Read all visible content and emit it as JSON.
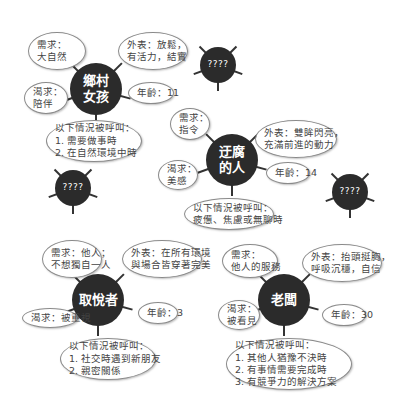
{
  "characters": [
    {
      "name_lines": [
        "鄉村",
        "女孩"
      ],
      "need": [
        "需求：",
        "大自然"
      ],
      "appearance": [
        "外表：放鬆，",
        "有活力，結實"
      ],
      "desire": [
        "渴求：",
        "陪伴"
      ],
      "age": "年齡：11",
      "called_when": [
        "以下情況被呼叫：",
        "1. 需要做事時",
        "2. 在自然環境中時"
      ]
    },
    {
      "name_lines": [
        "迂腐",
        "的人"
      ],
      "need": [
        "需求：",
        "指令"
      ],
      "appearance": [
        "外表：雙眸閃亮，",
        "充滿前進的動力"
      ],
      "desire": [
        "渴求：",
        "美感"
      ],
      "age": "年齡：14",
      "called_when": [
        "以下情況被呼叫：",
        "疲憊、焦慮或無聊時"
      ]
    },
    {
      "name_lines": [
        "取悅者"
      ],
      "need": [
        "需求：他人；",
        "不想獨自一人"
      ],
      "appearance": [
        "外表：在所有環境",
        "與場合皆穿著完美"
      ],
      "desire": [
        "渴求：被重視"
      ],
      "age": "年齡：3",
      "called_when": [
        "以下情況被呼叫：",
        "1. 社交時遇到新朋友",
        "2. 親密關係"
      ]
    },
    {
      "name_lines": [
        "老闆"
      ],
      "need": [
        "需求：",
        "他人的服務"
      ],
      "appearance": [
        "外表：抬頭挺胸，",
        "呼吸沉穩，自信"
      ],
      "desire": [
        "渴求：",
        "被看見"
      ],
      "age": "年齡：30",
      "called_when": [
        "以下情況被呼叫：",
        "1. 其他人猶豫不決時",
        "2. 有事情需要完成時",
        "3. 有競爭力的解決方案"
      ]
    }
  ],
  "unknown_label": "????",
  "colors": {
    "hub": "#2b2b2b",
    "bubble_border": "#8a8a8a",
    "text": "#444444"
  }
}
